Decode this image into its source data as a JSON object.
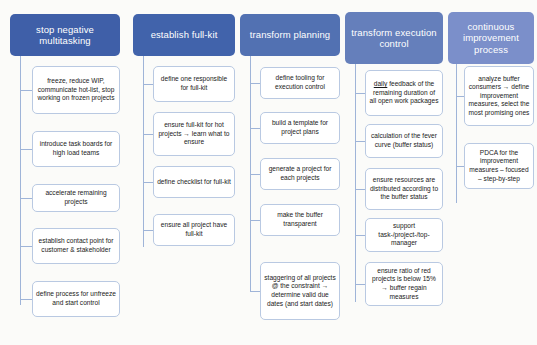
{
  "diagram": {
    "background_color": "#fbfbf9",
    "node_border_color": "#b9c9e2",
    "connector_color": "#9fb4d8",
    "columns": [
      {
        "id": "stop-negative-multitasking",
        "header": "stop negative multitasking",
        "header_color": "#3f5fa8",
        "x": 10,
        "width": 110,
        "header_top": 14,
        "header_height": 42,
        "trunk_x": 20,
        "trunk_top": 56,
        "trunk_bottom": 305,
        "node_x": 32,
        "node_width": 88,
        "nodes": [
          {
            "text": "freeze, reduce WIP, communicate hot-list, stop working on frozen projects",
            "top": 66,
            "height": 48
          },
          {
            "text": "introduce task boards for high load teams",
            "top": 131,
            "height": 36
          },
          {
            "text": "accelerate remaining projects",
            "top": 184,
            "height": 28
          },
          {
            "text": "establish contact point for customer & stakeholder",
            "top": 228,
            "height": 36
          },
          {
            "text": "define process for unfreeze and start control",
            "top": 281,
            "height": 36
          }
        ]
      },
      {
        "id": "establish-full-kit",
        "header": "establish full-kit",
        "header_color": "#4163ab",
        "x": 133,
        "width": 102,
        "header_top": 14,
        "header_height": 42,
        "trunk_x": 143,
        "trunk_top": 56,
        "trunk_bottom": 247,
        "node_x": 153,
        "node_width": 82,
        "nodes": [
          {
            "text": "define one responsible for full-kit",
            "top": 66,
            "height": 36
          },
          {
            "text": "ensure full-kit for hot projects → learn what to ensure",
            "top": 112,
            "height": 44
          },
          {
            "text": "define checklist for full-kit",
            "top": 166,
            "height": 32
          },
          {
            "text": "ensure all project have full-kit",
            "top": 214,
            "height": 32
          }
        ]
      },
      {
        "id": "transform-planning",
        "header": "transform planning",
        "header_color": "#5271b2",
        "x": 240,
        "width": 100,
        "header_top": 14,
        "header_height": 42,
        "trunk_x": 250,
        "trunk_top": 56,
        "trunk_bottom": 292,
        "node_x": 260,
        "node_width": 80,
        "nodes": [
          {
            "text": "define tooling for execution control",
            "top": 67,
            "height": 32
          },
          {
            "text": "build a template for project plans",
            "top": 112,
            "height": 32
          },
          {
            "text": "generate a project for each projects",
            "top": 158,
            "height": 32
          },
          {
            "text": "make the buffer transparent",
            "top": 204,
            "height": 32
          },
          {
            "text": "staggering of all projects @ the constraint → determine valid due dates (and start dates)",
            "top": 262,
            "height": 58
          }
        ]
      },
      {
        "id": "transform-execution-control",
        "header": "transform execution control",
        "header_color": "#657fbb",
        "x": 345,
        "width": 98,
        "header_top": 12,
        "header_height": 52,
        "trunk_x": 355,
        "trunk_top": 64,
        "trunk_bottom": 302,
        "node_x": 365,
        "node_width": 78,
        "nodes": [
          {
            "text": "<u>daily</u> feedback of the remaining duration of all open work packages",
            "html": true,
            "top": 70,
            "height": 46
          },
          {
            "text": "calculation of the fever curve (buffer status)",
            "top": 124,
            "height": 34
          },
          {
            "text": "ensure resources are distributed according to the buffer status",
            "top": 168,
            "height": 42
          },
          {
            "text": "support task-/project-/top-manager",
            "top": 218,
            "height": 34
          },
          {
            "text": "ensure ratio of red projects is below 15% → buffer regain measures",
            "top": 262,
            "height": 44
          }
        ]
      },
      {
        "id": "continuous-improvement-process",
        "header": "continuous improvement process",
        "header_color": "#7b8fca",
        "x": 448,
        "width": 86,
        "header_top": 12,
        "header_height": 52,
        "trunk_x": 456,
        "trunk_top": 64,
        "trunk_bottom": 203,
        "node_x": 464,
        "node_width": 70,
        "nodes": [
          {
            "text": "analyze buffer consumers → define improvement measures, select the most promising ones",
            "top": 66,
            "height": 60
          },
          {
            "text": "PDCA for the improvement measures – focused – step-by-step",
            "top": 143,
            "height": 46
          }
        ]
      }
    ]
  }
}
